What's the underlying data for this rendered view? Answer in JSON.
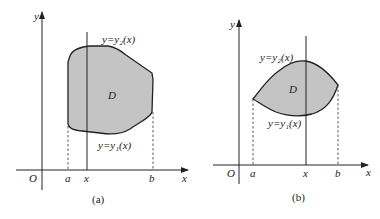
{
  "figure_a": {
    "caption": "(a)",
    "axis_y_label": "y",
    "axis_x_label": "x",
    "origin_label": "O",
    "tick_a": "a",
    "tick_x": "x",
    "tick_b": "b",
    "region_label": "D",
    "upper_curve_label": "y=y₂(x)",
    "lower_curve_label": "y=y₁(x)"
  },
  "figure_b": {
    "caption": "(b)",
    "axis_y_label": "y",
    "axis_x_label": "x",
    "origin_label": "O",
    "tick_a": "a",
    "tick_x": "x",
    "tick_b": "b",
    "region_label": "D",
    "upper_curve_label": "y=y₂(x)",
    "lower_curve_label": "y=y₁(x)"
  },
  "colors": {
    "region_fill": "#c4c4c4",
    "stroke": "#222222"
  }
}
